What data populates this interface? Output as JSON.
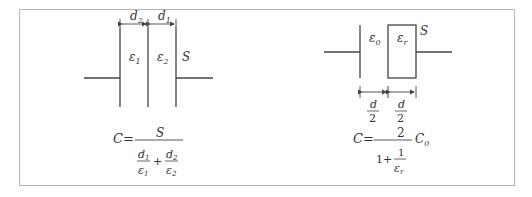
{
  "left_diagram": {
    "name": "series-dielectric-capacitor",
    "dimension_labels": {
      "left": "d",
      "left_sub": "2",
      "right": "d",
      "right_sub": "1"
    },
    "permittivity_labels": {
      "left": "ε",
      "left_sub": "1",
      "right": "ε",
      "right_sub": "2"
    },
    "area_label": "S",
    "formula": {
      "lhs": "C=",
      "numerator": "S",
      "term1_num": "d",
      "term1_num_sub": "1",
      "term1_den": "ε",
      "term1_den_sub": "1",
      "plus": "+",
      "term2_num": "d",
      "term2_num_sub": "2",
      "term2_den": "ε",
      "term2_den_sub": "2"
    }
  },
  "right_diagram": {
    "name": "half-filled-dielectric-capacitor",
    "permittivity_labels": {
      "left": "ε",
      "left_sub": "0",
      "right": "ε",
      "right_sub": "r"
    },
    "area_label": "S",
    "dimension_labels": {
      "left_num": "d",
      "left_den": "2",
      "right_num": "d",
      "right_den": "2"
    },
    "formula": {
      "lhs": "C=",
      "numerator": "2",
      "den_one": "1+",
      "den_frac_num": "1",
      "den_frac_den": "ε",
      "den_frac_den_sub": "r",
      "factor": "C",
      "factor_sub": "0"
    }
  },
  "colors": {
    "line": "#444444",
    "border": "#b5b5b5",
    "text": "#333333"
  }
}
